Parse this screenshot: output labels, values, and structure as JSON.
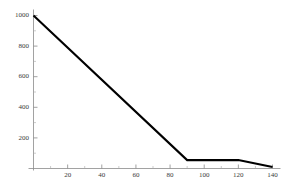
{
  "chart_data": {
    "type": "line",
    "title": "",
    "subtitle": "",
    "xlabel": "",
    "ylabel": "",
    "xlim": [
      0,
      145
    ],
    "ylim": [
      0,
      1040
    ],
    "grid": false,
    "legend": null,
    "background_color": "#ffffff",
    "axis_color": "#8a8a8a",
    "series": [
      {
        "name": "series-1",
        "color": "#000000",
        "x": [
          0,
          90,
          120,
          140
        ],
        "y": [
          1000,
          55,
          55,
          10
        ]
      }
    ],
    "x_ticks": [
      20,
      40,
      60,
      80,
      100,
      120,
      140
    ],
    "x_tick_labels": [
      "20",
      "40",
      "60",
      "80",
      "100",
      "120",
      "140"
    ],
    "x_minor_ticks": [
      10,
      30,
      50,
      70,
      90,
      110,
      130
    ],
    "y_ticks": [
      200,
      400,
      600,
      800,
      1000
    ],
    "y_tick_labels": [
      "200",
      "400",
      "600",
      "800",
      "1000"
    ],
    "y_minor_ticks": [
      100,
      300,
      500,
      700,
      900
    ]
  }
}
